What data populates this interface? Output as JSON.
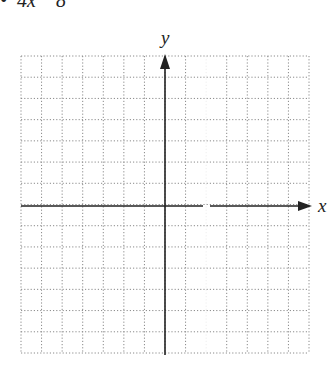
{
  "header_fragment": "•  4x    8",
  "graph": {
    "x_label": "x",
    "y_label": "y",
    "grid": {
      "left": 21,
      "top": 56,
      "right": 309,
      "bottom": 353,
      "cols": 14,
      "rows": 14,
      "style": "dotted",
      "color": "#8a8a8a"
    },
    "origin": {
      "x": 165,
      "y": 206
    },
    "axis_color": "#222222"
  }
}
